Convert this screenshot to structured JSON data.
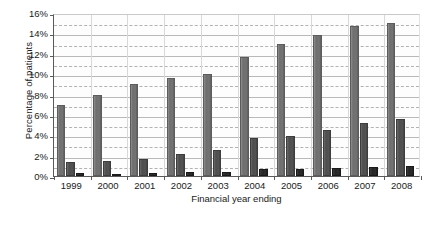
{
  "chart_data": {
    "type": "bar",
    "title": "",
    "xlabel": "Financial year ending",
    "ylabel": "Percentage of patients",
    "categories": [
      "1999",
      "2000",
      "2001",
      "2002",
      "2003",
      "2004",
      "2005",
      "2006",
      "2007",
      "2008"
    ],
    "series": [
      {
        "name": "series-1",
        "color": "#6f6f6f",
        "values": [
          7.0,
          8.0,
          9.0,
          9.6,
          10.0,
          11.7,
          13.0,
          13.8,
          14.7,
          15.0
        ]
      },
      {
        "name": "series-2",
        "color": "#4e4e4e",
        "values": [
          1.4,
          1.5,
          1.7,
          2.2,
          2.6,
          3.7,
          3.9,
          4.5,
          5.2,
          5.6
        ]
      },
      {
        "name": "series-3",
        "color": "#262626",
        "values": [
          0.25,
          0.2,
          0.3,
          0.35,
          0.4,
          0.7,
          0.7,
          0.8,
          0.9,
          0.95
        ]
      }
    ],
    "ylim": [
      0,
      16
    ],
    "ytick_step": 2,
    "yticks": [
      "0%",
      "2%",
      "4%",
      "6%",
      "8%",
      "10%",
      "12%",
      "14%",
      "16%"
    ],
    "ytick_values": [
      0,
      2,
      4,
      6,
      8,
      10,
      12,
      14,
      16
    ],
    "gridlines_solid": [
      2,
      4,
      6,
      8,
      10,
      12,
      14,
      16
    ],
    "gridlines_dashed": [
      1,
      3,
      5,
      7,
      9,
      11,
      13,
      15
    ],
    "grid": true,
    "legend": "none",
    "legend_position": "none"
  }
}
